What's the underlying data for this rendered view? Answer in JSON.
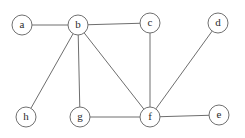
{
  "figure": {
    "background_color": "#ffffff",
    "width": 245,
    "height": 138
  },
  "style": {
    "edge_color": "#6e6e6e",
    "node_stroke_color": "#707070",
    "node_fill_color": "#ffffff",
    "label_color": "#2b2b2b",
    "node_radius": 10,
    "edge_width": 1
  },
  "graph": {
    "type": "undirected",
    "node_count": 8,
    "edge_count": 9,
    "nodes": [
      {
        "id": "a",
        "label": "a",
        "x": 22,
        "y": 25
      },
      {
        "id": "b",
        "label": "b",
        "x": 78,
        "y": 25
      },
      {
        "id": "c",
        "label": "c",
        "x": 150,
        "y": 23
      },
      {
        "id": "d",
        "label": "d",
        "x": 218,
        "y": 23
      },
      {
        "id": "e",
        "label": "e",
        "x": 219,
        "y": 115
      },
      {
        "id": "f",
        "label": "f",
        "x": 150,
        "y": 117
      },
      {
        "id": "g",
        "label": "g",
        "x": 80,
        "y": 117
      },
      {
        "id": "h",
        "label": "h",
        "x": 26,
        "y": 117
      }
    ],
    "edges": [
      {
        "from": "a",
        "to": "b"
      },
      {
        "from": "b",
        "to": "c"
      },
      {
        "from": "b",
        "to": "h"
      },
      {
        "from": "b",
        "to": "g"
      },
      {
        "from": "b",
        "to": "f"
      },
      {
        "from": "c",
        "to": "f"
      },
      {
        "from": "g",
        "to": "f"
      },
      {
        "from": "f",
        "to": "e"
      },
      {
        "from": "f",
        "to": "d"
      }
    ]
  }
}
